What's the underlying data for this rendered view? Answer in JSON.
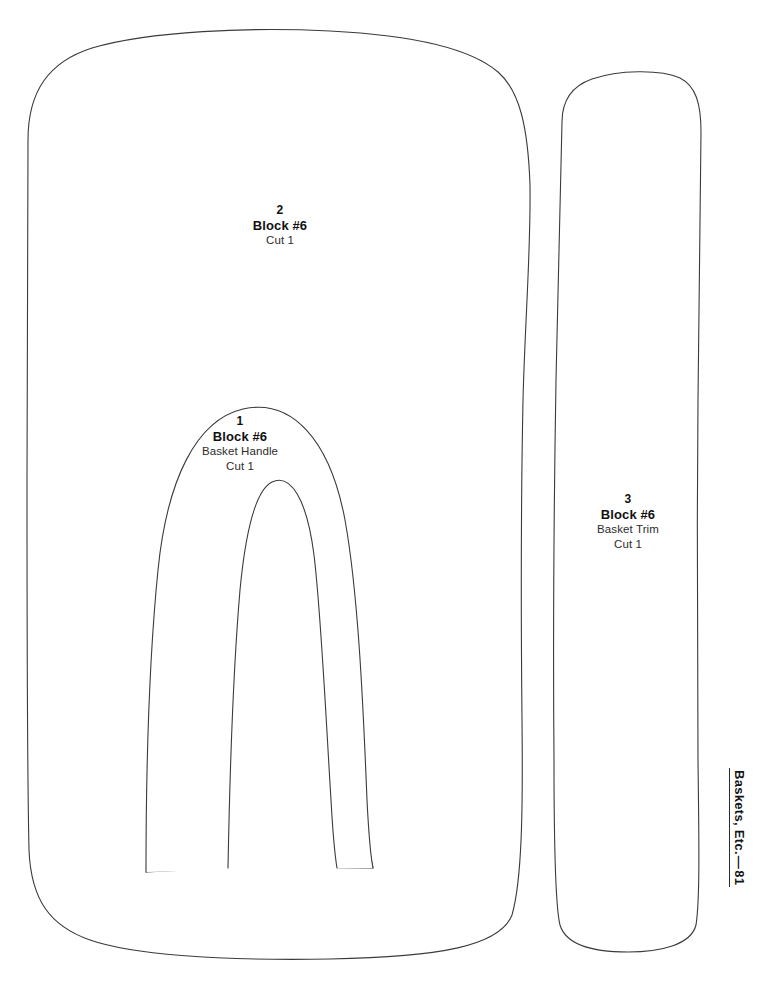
{
  "document": {
    "kind": "quilt-pattern-template-page",
    "background_color": "#ffffff",
    "outline_color": "#3b3b3f",
    "text_color": "#111111"
  },
  "pieces": [
    {
      "id": "piece-1",
      "number": "1",
      "title": "Block #6",
      "subtitle": "Basket Handle",
      "cut": "Cut 1"
    },
    {
      "id": "piece-2",
      "number": "2",
      "title": "Block #6",
      "subtitle": "",
      "cut": "Cut 1"
    },
    {
      "id": "piece-3",
      "number": "3",
      "title": "Block #6",
      "subtitle": "Basket Trim",
      "cut": "Cut 1"
    }
  ],
  "footer": {
    "title": "Baskets, Etc.",
    "dash": "—",
    "page": "81"
  }
}
